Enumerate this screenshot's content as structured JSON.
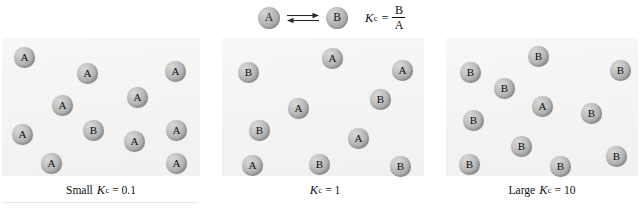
{
  "figure": {
    "equation": {
      "reactant_label": "A",
      "product_label": "B",
      "arrow_icon": "equilibrium-double-arrow-icon",
      "kc_symbol": "K",
      "kc_subscript": "c",
      "equals": "=",
      "numerator": "B",
      "denominator": "A"
    },
    "panels": [
      {
        "id": "small-kc",
        "caption_lead": "Small",
        "caption_kc": "K",
        "caption_kc_sub": "c",
        "caption_tail": "= 0.1",
        "count_a": 10,
        "count_b": 1,
        "molecules": [
          {
            "label": "A",
            "x": 12,
            "y": 9
          },
          {
            "label": "A",
            "x": 75,
            "y": 25
          },
          {
            "label": "A",
            "x": 163,
            "y": 23
          },
          {
            "label": "A",
            "x": 50,
            "y": 57
          },
          {
            "label": "A",
            "x": 125,
            "y": 49
          },
          {
            "label": "A",
            "x": 10,
            "y": 86
          },
          {
            "label": "B",
            "x": 81,
            "y": 82
          },
          {
            "label": "A",
            "x": 122,
            "y": 93
          },
          {
            "label": "A",
            "x": 164,
            "y": 82
          },
          {
            "label": "A",
            "x": 39,
            "y": 115
          },
          {
            "label": "A",
            "x": 164,
            "y": 115
          }
        ]
      },
      {
        "id": "unit-kc",
        "caption_lead": "",
        "caption_kc": "K",
        "caption_kc_sub": "c",
        "caption_tail": "= 1",
        "count_a": 5,
        "count_b": 6,
        "molecules": [
          {
            "label": "B",
            "x": 16,
            "y": 24
          },
          {
            "label": "A",
            "x": 100,
            "y": 10
          },
          {
            "label": "A",
            "x": 170,
            "y": 22
          },
          {
            "label": "B",
            "x": 148,
            "y": 51
          },
          {
            "label": "A",
            "x": 66,
            "y": 60
          },
          {
            "label": "B",
            "x": 27,
            "y": 82
          },
          {
            "label": "A",
            "x": 126,
            "y": 90
          },
          {
            "label": "A",
            "x": 20,
            "y": 117
          },
          {
            "label": "B",
            "x": 87,
            "y": 116
          },
          {
            "label": "B",
            "x": 168,
            "y": 118
          }
        ]
      },
      {
        "id": "large-kc",
        "caption_lead": "Large",
        "caption_kc": "K",
        "caption_kc_sub": "c",
        "caption_tail": "= 10",
        "count_a": 1,
        "count_b": 10,
        "molecules": [
          {
            "label": "B",
            "x": 14,
            "y": 24
          },
          {
            "label": "B",
            "x": 82,
            "y": 8
          },
          {
            "label": "B",
            "x": 164,
            "y": 22
          },
          {
            "label": "B",
            "x": 48,
            "y": 40
          },
          {
            "label": "A",
            "x": 86,
            "y": 58
          },
          {
            "label": "B",
            "x": 135,
            "y": 65
          },
          {
            "label": "B",
            "x": 17,
            "y": 72
          },
          {
            "label": "B",
            "x": 65,
            "y": 98
          },
          {
            "label": "B",
            "x": 13,
            "y": 116
          },
          {
            "label": "B",
            "x": 104,
            "y": 118
          },
          {
            "label": "B",
            "x": 160,
            "y": 108
          }
        ]
      }
    ]
  }
}
